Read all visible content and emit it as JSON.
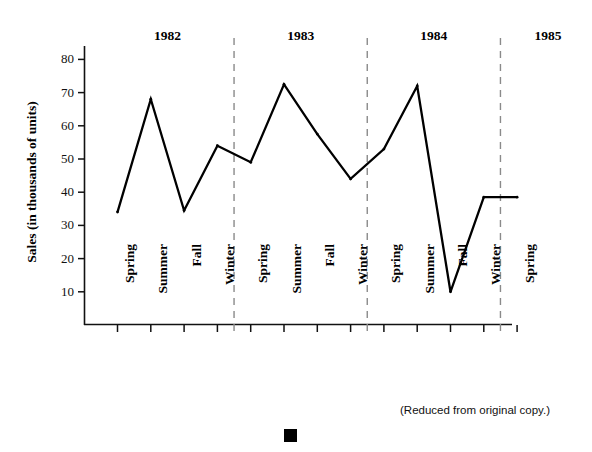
{
  "figure": {
    "footnote": "(Reduced from original copy.)",
    "marker_name": "black-square-marker"
  },
  "chart_data": {
    "type": "line",
    "title": "",
    "xlabel": "",
    "ylabel": "Sales (in thousands of units)",
    "ylim": [
      0,
      85
    ],
    "yticks": [
      10,
      20,
      30,
      40,
      50,
      60,
      70,
      80
    ],
    "ytick_labels": [
      "10",
      "20",
      "30",
      "40",
      "50",
      "60",
      "70",
      "80"
    ],
    "grid": false,
    "legend": null,
    "categories": [
      "Spring",
      "Summer",
      "Fall",
      "Winter",
      "Spring",
      "Summer",
      "Fall",
      "Winter",
      "Spring",
      "Summer",
      "Fall",
      "Winter",
      "Spring"
    ],
    "x": [
      "Spring 1982",
      "Summer 1982",
      "Fall 1982",
      "Winter 1982",
      "Spring 1983",
      "Summer 1983",
      "Fall 1983",
      "Winter 1983",
      "Spring 1984",
      "Summer 1984",
      "Fall 1984",
      "Winter 1984",
      "Spring 1985"
    ],
    "values": [
      34,
      68,
      34.5,
      54,
      49,
      72.5,
      57.5,
      44,
      53,
      72,
      10,
      38.5,
      38.5
    ],
    "series": [
      {
        "name": "Sales",
        "values": [
          34,
          68,
          34.5,
          54,
          49,
          72.5,
          57.5,
          44,
          53,
          72,
          10,
          38.5,
          38.5
        ],
        "color": "#000000"
      }
    ],
    "year_groups": [
      {
        "label": "1982",
        "start_index": 0,
        "end_index": 3
      },
      {
        "label": "1983",
        "start_index": 4,
        "end_index": 7
      },
      {
        "label": "1984",
        "start_index": 8,
        "end_index": 11
      },
      {
        "label": "1985",
        "start_index": 12,
        "end_index": 12
      }
    ],
    "year_dividers": [
      "after Winter 1982",
      "after Winter 1983",
      "after Winter 1984"
    ],
    "annotations": []
  }
}
